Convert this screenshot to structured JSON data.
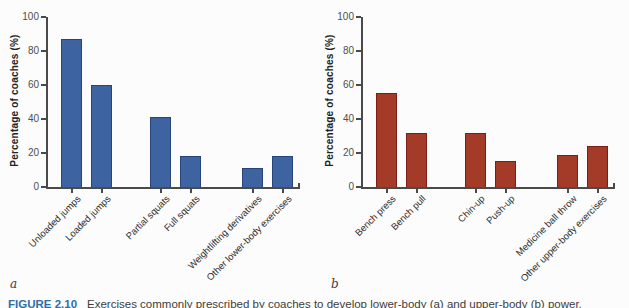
{
  "figure": {
    "panel_a_letter": "a",
    "panel_b_letter": "b",
    "caption_label": "FIGURE 2.10",
    "caption_text": "Exercises commonly prescribed by coaches to develop lower-body (a) and upper-body (b) power."
  },
  "colors": {
    "bar_a_fill": "#3d63a1",
    "bar_a_border": "#27447c",
    "bar_b_fill": "#a33b28",
    "bar_b_border": "#7a1e16",
    "axis": "#4a4a4a",
    "caption_label_color": "#2f6fa7"
  },
  "chart_data": [
    {
      "type": "bar",
      "panel": "a",
      "title": "",
      "xlabel": "",
      "ylabel": "Percentage of coaches (%)",
      "ylim": [
        0,
        100
      ],
      "yticks": [
        0,
        20,
        40,
        60,
        80,
        100
      ],
      "grid": false,
      "legend": "none",
      "categories": [
        "Unloaded jumps",
        "Loaded jumps",
        "Partial squats",
        "Full squats",
        "Weightlifting derivatives",
        "Other lower-body exercises"
      ],
      "values": [
        87,
        60,
        41,
        18,
        11,
        18
      ],
      "bar_color": "#3d63a1"
    },
    {
      "type": "bar",
      "panel": "b",
      "title": "",
      "xlabel": "",
      "ylabel": "Percentage of coaches (%)",
      "ylim": [
        0,
        100
      ],
      "yticks": [
        0,
        20,
        40,
        60,
        80,
        100
      ],
      "grid": false,
      "legend": "none",
      "categories": [
        "Bench press",
        "Bench pull",
        "Chin-up",
        "Push-up",
        "Medicine ball throw",
        "Other upper-body exercises"
      ],
      "values": [
        55,
        32,
        32,
        15,
        19,
        24
      ],
      "bar_color": "#a33b28"
    }
  ]
}
